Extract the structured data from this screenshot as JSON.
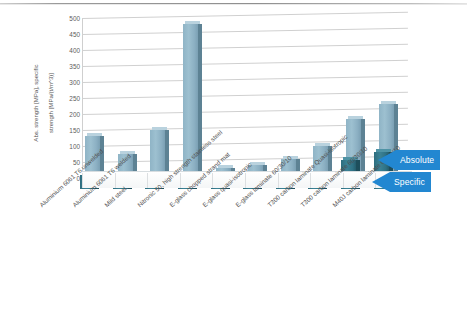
{
  "chart_data": {
    "type": "bar",
    "title": "",
    "subtitle": "",
    "xlabel": "",
    "ylabel": "Abs. strength [MPa], specific strength [MPa/(t/m^3)]",
    "ylim": [
      0,
      500
    ],
    "yticks": [
      0,
      50,
      100,
      150,
      200,
      250,
      300,
      350,
      400,
      450,
      500
    ],
    "ytick_labels": [
      "0",
      "50",
      "100",
      "150",
      "200",
      "250",
      "300",
      "350",
      "400",
      "450",
      "500"
    ],
    "grid": true,
    "legend_position": "right-arrows",
    "style": "3d-bar",
    "categories": [
      "Aluminium 6061 T6 unwelded",
      "Aluminium 6061 T6 welded",
      "Mild steel",
      "Nitronic 50, high strength stainless steel",
      "E-glass chopped strand mat",
      "E-glass quasi-isotropic",
      "E-glass laminate 60/30/10",
      "T300 carbon laminate Quasi-isotropic",
      "T300 carbon laminate 60/30/10",
      "M40J carbon laminate 60/30/10"
    ],
    "series": [
      {
        "name": "Absolute",
        "color": "#8fb4c6",
        "values": [
          130,
          75,
          150,
          480,
          30,
          40,
          60,
          100,
          185,
          230
        ]
      },
      {
        "name": "Specific",
        "color": "#2f7285",
        "values": [
          45,
          20,
          18,
          45,
          10,
          10,
          12,
          38,
          90,
          115
        ]
      }
    ],
    "annotations": [
      {
        "text": "Absolute",
        "type": "arrow-callout",
        "points_to": "back-row-light-bars"
      },
      {
        "text": "Specific",
        "type": "arrow-callout",
        "points_to": "front-row-dark-bars"
      }
    ]
  },
  "axis": {
    "y_title_line1": "Abs. strength [MPa], specific",
    "y_title_line2": "strength [MPa/(t/m^3)]"
  },
  "callouts": {
    "absolute_label": "Absolute",
    "specific_label": "Specific"
  },
  "colors": {
    "series_absolute": "#8fb4c6",
    "series_specific": "#2f7285",
    "callout_blue": "#2287d1",
    "gridline": "#d0d0d0",
    "text": "#4f4f4f",
    "background": "#ffffff"
  }
}
